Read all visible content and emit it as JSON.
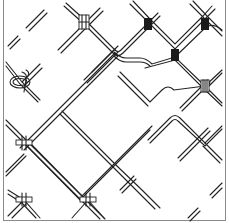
{
  "figure": {
    "type": "patent line drawing",
    "colors": {
      "line": "#222222",
      "frame": "#8a8a8a",
      "background": "#ffffff"
    },
    "regions": [
      {
        "name": "top-left",
        "content": "loose parallel double-wire segments and a twisted-loop clip connector"
      },
      {
        "name": "top-right",
        "content": "diamond mesh of double wires with dark block clips at crossings"
      },
      {
        "name": "bottom-left",
        "content": "straight crossing double wires with flat bar clips"
      },
      {
        "name": "bottom-right",
        "content": "wave-bent double wires, partial diamonds"
      }
    ],
    "clips": [
      {
        "kind": "bracket-clip",
        "x": 84,
        "y": 22
      },
      {
        "kind": "dark-clip",
        "x": 148,
        "y": 24
      },
      {
        "kind": "dark-clip",
        "x": 205,
        "y": 24
      },
      {
        "kind": "dark-clip",
        "x": 175,
        "y": 55
      },
      {
        "kind": "striped-clip",
        "x": 205,
        "y": 86
      },
      {
        "kind": "loop-clip",
        "x": 22,
        "y": 82
      },
      {
        "kind": "bar-clip",
        "x": 24,
        "y": 143
      },
      {
        "kind": "bar-clip",
        "x": 24,
        "y": 200
      },
      {
        "kind": "bar-clip",
        "x": 88,
        "y": 200
      }
    ]
  }
}
